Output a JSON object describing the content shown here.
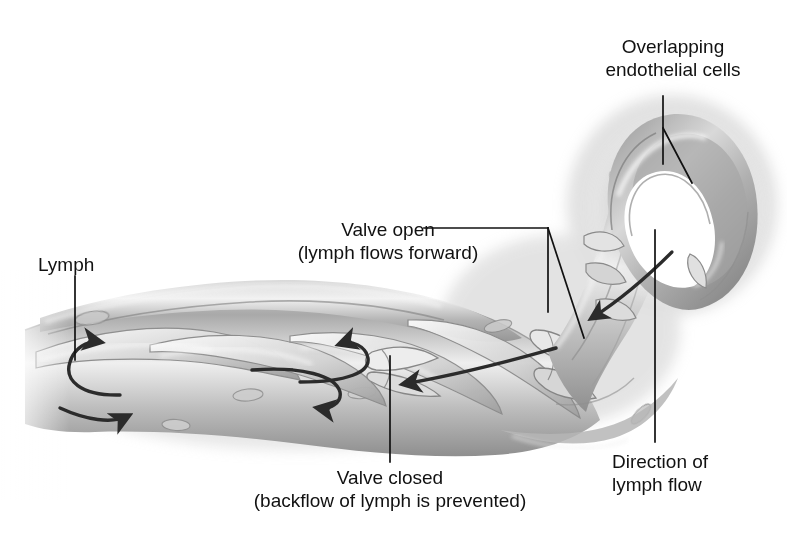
{
  "figure": {
    "title_alt": "Lymphatic capillary structure and lymph flow",
    "style": "grayscale medical illustration",
    "background_color": "#ffffff",
    "ink_color": "#111111"
  },
  "labels": {
    "overlapping_cells": {
      "line1": "Overlapping",
      "line2": "endothelial cells"
    },
    "valve_open": {
      "line1": "Valve open",
      "line2": "(lymph flows forward)"
    },
    "lymph": {
      "line1": "Lymph"
    },
    "valve_closed": {
      "line1": "Valve closed",
      "line2": "(backflow of lymph is prevented)"
    },
    "direction_flow": {
      "line1": "Direction of",
      "line2": "lymph flow"
    }
  },
  "annotations": {
    "arrows": [
      {
        "name": "lymph-entry-arrow-upper",
        "meaning": "lymph entering capillary"
      },
      {
        "name": "lymph-entry-arrow-lower",
        "meaning": "lymph entering capillary"
      },
      {
        "name": "backflow-arrow-upper",
        "meaning": "backflow blocked by closed valve"
      },
      {
        "name": "backflow-arrow-lower",
        "meaning": "backflow blocked by closed valve"
      },
      {
        "name": "forward-flow-arrow",
        "meaning": "lymph flows forward through open valve"
      },
      {
        "name": "direction-of-flow-arrow",
        "meaning": "overall direction of lymph flow"
      }
    ],
    "leader_lines": [
      {
        "name": "leader-overlapping-cells"
      },
      {
        "name": "leader-valve-open"
      },
      {
        "name": "leader-lymph"
      },
      {
        "name": "leader-valve-closed"
      },
      {
        "name": "leader-direction-flow"
      }
    ]
  },
  "palette": {
    "vessel_light": "#f2f2f2",
    "vessel_mid": "#b9b9b9",
    "vessel_dark": "#8a8a8a",
    "vessel_shadow": "#6e6e6e",
    "lumen_white": "#ffffff",
    "ink": "#111111"
  }
}
